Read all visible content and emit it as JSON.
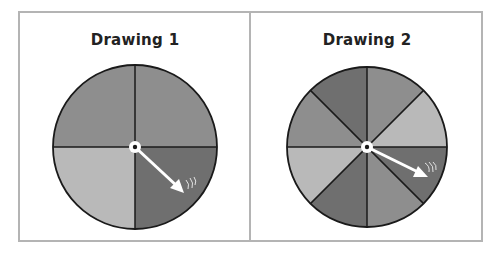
{
  "drawings": [
    {
      "title": "Drawing 1",
      "sectors": 4,
      "sector_colors": [
        "medium",
        "dark",
        "light",
        "medium"
      ],
      "pointer": "spinner-arrow"
    },
    {
      "title": "Drawing 2",
      "sectors": 8,
      "sector_colors": [
        "medium",
        "light",
        "dark",
        "medium",
        "dark",
        "light",
        "medium",
        "dark"
      ],
      "pointer": "spinner-arrow"
    }
  ],
  "colors": {
    "light": "#b9b9b9",
    "medium": "#8e8e8e",
    "dark": "#6f6f6f",
    "frame": "#b4b4b4",
    "outline": "#1a1a1a",
    "arrow": "#ffffff"
  }
}
